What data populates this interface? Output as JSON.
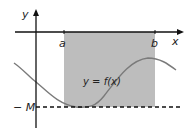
{
  "diagram": {
    "axis_labels": {
      "x": "x",
      "y": "y"
    },
    "points": {
      "a": "a",
      "b": "b"
    },
    "function_label": "y = f(x)",
    "bound_label": "− M",
    "colors": {
      "shade": "#bdbdbd",
      "curve": "#7a7a7a",
      "axis": "#111111"
    }
  }
}
